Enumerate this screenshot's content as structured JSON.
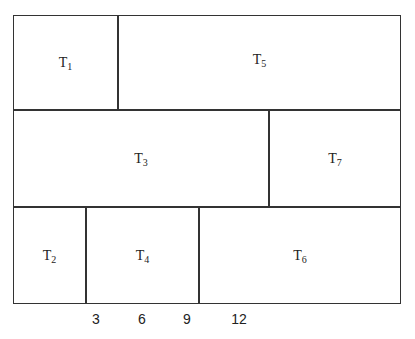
{
  "diagram": {
    "type": "block-schedule",
    "rows": [
      {
        "blocks": [
          {
            "id": "T1",
            "base": "T",
            "sub": "1"
          },
          {
            "id": "T5",
            "base": "T",
            "sub": "5"
          }
        ]
      },
      {
        "blocks": [
          {
            "id": "T3",
            "base": "T",
            "sub": "3"
          },
          {
            "id": "T7",
            "base": "T",
            "sub": "7"
          }
        ]
      },
      {
        "blocks": [
          {
            "id": "T2",
            "base": "T",
            "sub": "2"
          },
          {
            "id": "T4",
            "base": "T",
            "sub": "4"
          },
          {
            "id": "T6",
            "base": "T",
            "sub": "6"
          }
        ]
      }
    ],
    "axis_ticks": [
      "3",
      "6",
      "9",
      "12"
    ]
  }
}
